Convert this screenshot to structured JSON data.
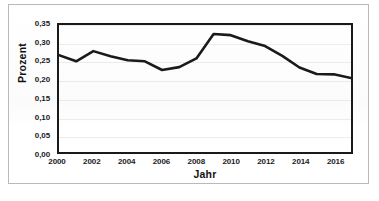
{
  "chart_data": {
    "type": "line",
    "title": "",
    "xlabel": "Jahr",
    "ylabel": "Prozent",
    "x": [
      2000,
      2001,
      2002,
      2003,
      2004,
      2005,
      2006,
      2007,
      2008,
      2009,
      2010,
      2011,
      2012,
      2013,
      2014,
      2015,
      2016,
      2017
    ],
    "values": [
      0.267,
      0.25,
      0.278,
      0.264,
      0.253,
      0.25,
      0.226,
      0.234,
      0.258,
      0.325,
      0.322,
      0.305,
      0.292,
      0.265,
      0.233,
      0.215,
      0.214,
      0.204
    ],
    "xlim": [
      2000,
      2017
    ],
    "ylim": [
      0.0,
      0.35
    ],
    "ytick_values": [
      0.35,
      0.3,
      0.25,
      0.2,
      0.15,
      0.1,
      0.05,
      0.0
    ],
    "ytick_labels": [
      "0,35",
      "0,30",
      "0,25",
      "0,20",
      "0,15",
      "0,10",
      "0,05",
      "0,00"
    ],
    "xtick_values": [
      2000,
      2002,
      2004,
      2006,
      2008,
      2010,
      2012,
      2014,
      2016
    ],
    "xtick_labels": [
      "2000",
      "2002",
      "2004",
      "2006",
      "2008",
      "2010",
      "2012",
      "2014",
      "2016"
    ],
    "grid": true,
    "legend": false,
    "series_color": "#1a1a1a",
    "gridline_color": "#ededed",
    "axis_color": "#1a1a1a"
  },
  "figure": {
    "caption_partial": ""
  }
}
